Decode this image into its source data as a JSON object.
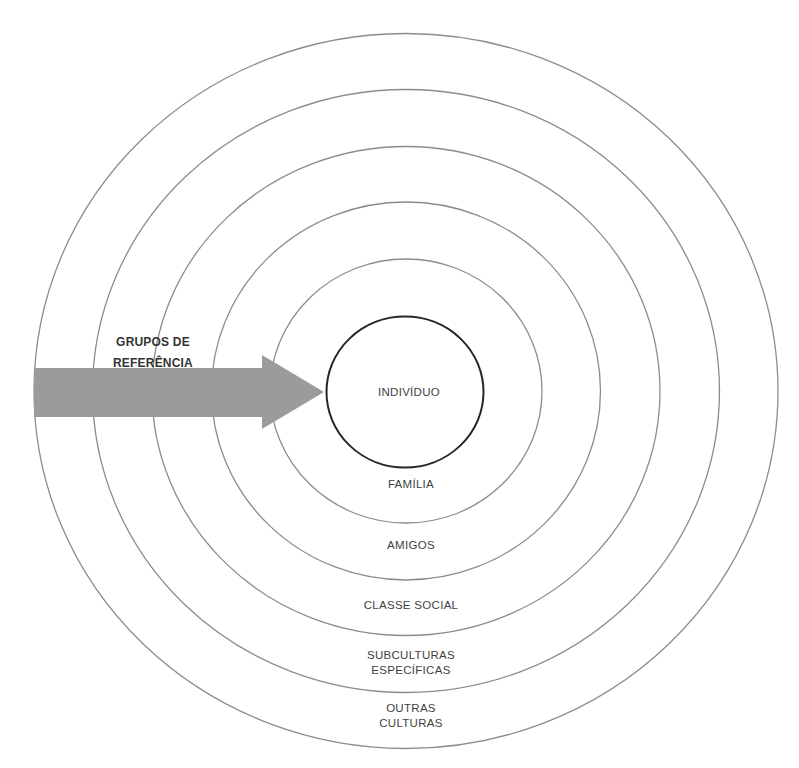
{
  "diagram": {
    "title": "",
    "center_label": "INDIVÍDUO",
    "rings": [
      {
        "lines": [
          "FAMÍLIA"
        ]
      },
      {
        "lines": [
          "AMIGOS"
        ]
      },
      {
        "lines": [
          "CLASSE SOCIAL"
        ]
      },
      {
        "lines": [
          "SUBCULTURAS",
          "ESPECÍFICAS"
        ]
      },
      {
        "lines": [
          "OUTRAS",
          "CULTURAS"
        ]
      }
    ],
    "arrow": {
      "label_lines": [
        "GRUPOS DE",
        "REFERÊNCIA"
      ],
      "direction": "pointing inward toward the individual"
    },
    "colors": {
      "ring_stroke": "#8c8c8c",
      "core_stroke": "#262626",
      "arrow_fill": "#9b9b9b",
      "text": "#3f3f3f"
    }
  }
}
